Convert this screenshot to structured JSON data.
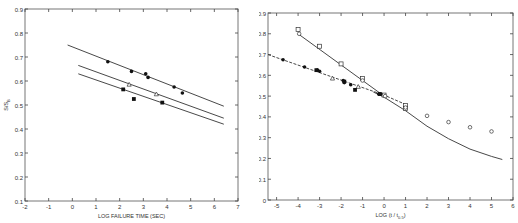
{
  "chart_data": [
    {
      "type": "scatter",
      "title": "",
      "xlabel": "LOG FAILURE TIME (SEC)",
      "ylabel": "S/S_B",
      "xlim": [
        -2,
        7
      ],
      "ylim": [
        0.1,
        0.9
      ],
      "xticks": [
        -2,
        -1,
        0,
        1,
        2,
        3,
        4,
        5,
        6,
        7
      ],
      "yticks": [
        0.1,
        0.2,
        0.3,
        0.4,
        0.5,
        0.6,
        0.7,
        0.8,
        0.9
      ],
      "grid": false,
      "legend": null,
      "series": [
        {
          "name": "filled circles",
          "marker": "filled-circle",
          "points": [
            [
              1.5,
              0.68
            ],
            [
              2.5,
              0.64
            ],
            [
              3.1,
              0.63
            ],
            [
              3.2,
              0.615
            ],
            [
              4.3,
              0.575
            ],
            [
              4.65,
              0.55
            ]
          ]
        },
        {
          "name": "open triangles",
          "marker": "open-triangle",
          "points": [
            [
              2.4,
              0.585
            ],
            [
              3.55,
              0.545
            ]
          ]
        },
        {
          "name": "filled squares",
          "marker": "filled-square",
          "points": [
            [
              2.15,
              0.565
            ],
            [
              2.6,
              0.525
            ],
            [
              3.8,
              0.51
            ]
          ]
        }
      ],
      "lines": [
        {
          "name": "fit upper",
          "style": "solid",
          "points": [
            [
              -0.2,
              0.75
            ],
            [
              6.4,
              0.495
            ]
          ]
        },
        {
          "name": "fit middle",
          "style": "solid",
          "points": [
            [
              0.25,
              0.665
            ],
            [
              6.4,
              0.445
            ]
          ]
        },
        {
          "name": "fit lower",
          "style": "solid",
          "points": [
            [
              0.25,
              0.63
            ],
            [
              6.4,
              0.42
            ]
          ]
        }
      ]
    },
    {
      "type": "scatter",
      "title": "",
      "xlabel": "LOG (t / t0.5)",
      "ylabel": "S/S_B",
      "xlim": [
        -5.4,
        6
      ],
      "ylim": [
        0,
        0.9
      ],
      "xticks": [
        -5,
        -4,
        -3,
        -2,
        -1,
        0,
        1,
        2,
        3,
        4,
        5,
        6
      ],
      "yticks": [
        0,
        0.1,
        0.2,
        0.3,
        0.4,
        0.5,
        0.6,
        0.7,
        0.8,
        0.9
      ],
      "grid": false,
      "legend": null,
      "series": [
        {
          "name": "open squares",
          "marker": "open-square",
          "points": [
            [
              -4,
              0.82
            ],
            [
              -3,
              0.74
            ],
            [
              -2,
              0.655
            ],
            [
              -1,
              0.585
            ],
            [
              0,
              0.505
            ],
            [
              1,
              0.455
            ],
            [
              1,
              0.44
            ]
          ]
        },
        {
          "name": "open circles",
          "marker": "open-circle",
          "points": [
            [
              -3.95,
              0.8
            ],
            [
              -1,
              0.575
            ],
            [
              0.05,
              0.5
            ],
            [
              1,
              0.445
            ],
            [
              2,
              0.405
            ],
            [
              3,
              0.375
            ],
            [
              4,
              0.35
            ],
            [
              5,
              0.33
            ]
          ]
        },
        {
          "name": "filled circles",
          "marker": "filled-circle",
          "points": [
            [
              -4.7,
              0.675
            ],
            [
              -3.7,
              0.64
            ],
            [
              -3.1,
              0.625
            ],
            [
              -3.0,
              0.62
            ],
            [
              -1.9,
              0.575
            ],
            [
              -1.85,
              0.565
            ],
            [
              -1.55,
              0.555
            ],
            [
              -0.25,
              0.51
            ],
            [
              -0.15,
              0.51
            ]
          ]
        },
        {
          "name": "open triangles",
          "marker": "open-triangle",
          "points": [
            [
              -2.4,
              0.585
            ],
            [
              -1.2,
              0.545
            ]
          ]
        },
        {
          "name": "filled squares",
          "marker": "filled-square",
          "points": [
            [
              -3.15,
              0.625
            ],
            [
              -1.85,
              0.57
            ],
            [
              -1.35,
              0.53
            ],
            [
              -0.2,
              0.51
            ]
          ]
        }
      ],
      "lines": [
        {
          "name": "dashed fit",
          "style": "dashed",
          "points": [
            [
              -5.4,
              0.7
            ],
            [
              0,
              0.505
            ],
            [
              1,
              0.46
            ]
          ]
        },
        {
          "name": "steep solid fit",
          "style": "solid",
          "points": [
            [
              -4,
              0.8
            ],
            [
              0,
              0.5
            ]
          ]
        },
        {
          "name": "solid curve",
          "style": "solid",
          "points": [
            [
              -0.5,
              0.52
            ],
            [
              0,
              0.495
            ],
            [
              1,
              0.43
            ],
            [
              2,
              0.355
            ],
            [
              3,
              0.295
            ],
            [
              4,
              0.245
            ],
            [
              5,
              0.21
            ],
            [
              5.5,
              0.195
            ]
          ]
        }
      ]
    }
  ],
  "left": {
    "xlabel": "LOG FAILURE TIME (SEC)",
    "ylabel": "S/S",
    "ylabel_sub": "B"
  },
  "right": {
    "xlabel": "LOG (t / t",
    "xlabel_sub": "0.5",
    "xlabel_end": ")",
    "ylabel": "S/S",
    "ylabel_sub": "B"
  }
}
